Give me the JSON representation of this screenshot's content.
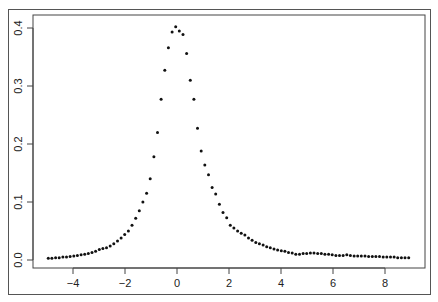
{
  "chart_data": {
    "type": "scatter",
    "title": "",
    "xlabel": "",
    "ylabel": "",
    "xlim": [
      -5.3,
      9.4
    ],
    "ylim": [
      -0.012,
      0.418
    ],
    "grid": false,
    "legend": null,
    "x_ticks": [
      -4,
      -2,
      0,
      2,
      4,
      6,
      8
    ],
    "x_tick_labels": [
      "−4",
      "−2",
      "0",
      "2",
      "4",
      "6",
      "8"
    ],
    "y_ticks": [
      0.0,
      0.1,
      0.2,
      0.3,
      0.4
    ],
    "y_tick_labels": [
      "0.0",
      "0.1",
      "0.2",
      "0.3",
      "0.4"
    ],
    "marker_color": "#111111",
    "series": [
      {
        "name": "density",
        "x": [
          -4.95,
          -4.81,
          -4.67,
          -4.53,
          -4.39,
          -4.25,
          -4.11,
          -3.97,
          -3.83,
          -3.69,
          -3.55,
          -3.41,
          -3.27,
          -3.13,
          -2.99,
          -2.85,
          -2.71,
          -2.57,
          -2.43,
          -2.29,
          -2.15,
          -2.01,
          -1.87,
          -1.73,
          -1.59,
          -1.45,
          -1.31,
          -1.17,
          -1.03,
          -0.89,
          -0.75,
          -0.61,
          -0.47,
          -0.33,
          -0.19,
          -0.05,
          0.09,
          0.23,
          0.37,
          0.51,
          0.65,
          0.79,
          0.93,
          1.07,
          1.21,
          1.35,
          1.49,
          1.63,
          1.77,
          1.91,
          2.05,
          2.19,
          2.33,
          2.47,
          2.61,
          2.75,
          2.89,
          3.03,
          3.17,
          3.31,
          3.45,
          3.59,
          3.73,
          3.87,
          4.01,
          4.15,
          4.29,
          4.43,
          4.57,
          4.71,
          4.85,
          4.99,
          5.13,
          5.27,
          5.41,
          5.55,
          5.69,
          5.83,
          5.97,
          6.11,
          6.25,
          6.39,
          6.53,
          6.67,
          6.81,
          6.95,
          7.09,
          7.23,
          7.37,
          7.51,
          7.65,
          7.79,
          7.93,
          8.07,
          8.21,
          8.35,
          8.49,
          8.63,
          8.77,
          8.91
        ],
        "y": [
          0.003,
          0.003,
          0.004,
          0.004,
          0.005,
          0.005,
          0.006,
          0.007,
          0.008,
          0.009,
          0.01,
          0.011,
          0.013,
          0.015,
          0.018,
          0.02,
          0.021,
          0.024,
          0.028,
          0.033,
          0.038,
          0.044,
          0.05,
          0.06,
          0.072,
          0.085,
          0.1,
          0.115,
          0.14,
          0.178,
          0.22,
          0.277,
          0.327,
          0.366,
          0.393,
          0.402,
          0.395,
          0.389,
          0.356,
          0.31,
          0.277,
          0.227,
          0.188,
          0.164,
          0.147,
          0.125,
          0.114,
          0.096,
          0.082,
          0.073,
          0.06,
          0.055,
          0.05,
          0.046,
          0.043,
          0.038,
          0.034,
          0.03,
          0.028,
          0.026,
          0.023,
          0.021,
          0.019,
          0.017,
          0.016,
          0.015,
          0.013,
          0.012,
          0.01,
          0.01,
          0.011,
          0.011,
          0.012,
          0.012,
          0.011,
          0.011,
          0.01,
          0.01,
          0.009,
          0.008,
          0.008,
          0.008,
          0.009,
          0.008,
          0.007,
          0.007,
          0.007,
          0.007,
          0.006,
          0.006,
          0.006,
          0.006,
          0.005,
          0.005,
          0.005,
          0.005,
          0.004,
          0.004,
          0.004,
          0.004
        ]
      }
    ]
  }
}
